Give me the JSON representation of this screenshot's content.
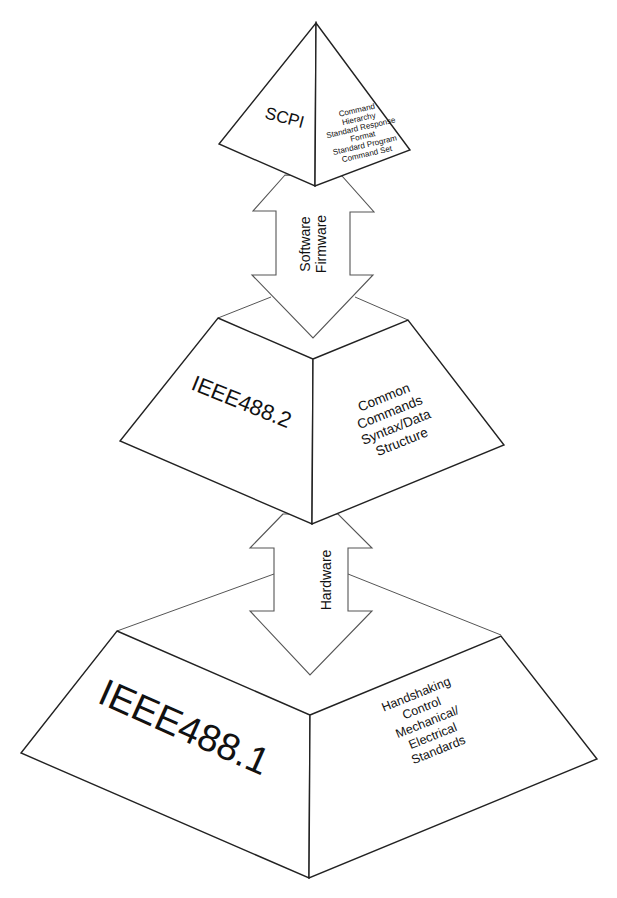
{
  "diagram": {
    "type": "layered-pyramid",
    "colors": {
      "background": "#ffffff",
      "stroke": "#222222"
    },
    "layers": [
      {
        "id": "scpi",
        "title": "SCPI",
        "description_lines": [
          "Command",
          "Hierarchy",
          "Standard Response",
          "Format",
          "Standard Program",
          "Command Set"
        ]
      },
      {
        "id": "ieee488-2",
        "title": "IEEE488.2",
        "description_lines": [
          "Common",
          "Commands",
          "Syntax/Data",
          "Structure"
        ]
      },
      {
        "id": "ieee488-1",
        "title": "IEEE488.1",
        "description_lines": [
          "Handshaking",
          "Control",
          "Mechanical/",
          "Electrical",
          "Standards"
        ]
      }
    ],
    "connectors": [
      {
        "id": "arrow-scpi-488-2",
        "from": "scpi",
        "to": "ieee488-2",
        "direction": "bidirectional",
        "label_lines": [
          "Software",
          "Firmware"
        ]
      },
      {
        "id": "arrow-488-2-488-1",
        "from": "ieee488-2",
        "to": "ieee488-1",
        "direction": "bidirectional",
        "label_lines": [
          "Hardware"
        ]
      }
    ]
  }
}
